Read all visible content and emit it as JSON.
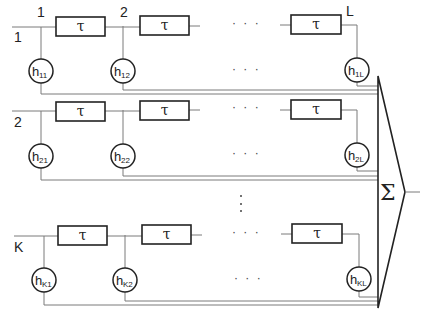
{
  "diagram": {
    "type": "tapped-delay-line filter bank with summation",
    "delay_label": "τ",
    "sum_label": "Σ",
    "ellipsis_h": "· · ·",
    "rows": [
      {
        "row_label": "1",
        "tap_labels": [
          "1",
          "2",
          "L"
        ],
        "coefficients": [
          {
            "h": "h",
            "sub": "11"
          },
          {
            "h": "h",
            "sub": "12"
          },
          {
            "h": "h",
            "sub": "1L"
          }
        ]
      },
      {
        "row_label": "2",
        "tap_labels": [],
        "coefficients": [
          {
            "h": "h",
            "sub": "21"
          },
          {
            "h": "h",
            "sub": "22"
          },
          {
            "h": "h",
            "sub": "2L"
          }
        ]
      },
      {
        "row_label": "K",
        "tap_labels": [],
        "coefficients": [
          {
            "h": "h",
            "sub": "K1"
          },
          {
            "h": "h",
            "sub": "K2"
          },
          {
            "h": "h",
            "sub": "KL"
          }
        ]
      }
    ]
  }
}
